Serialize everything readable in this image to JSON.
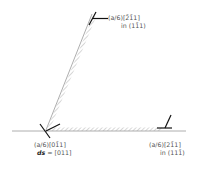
{
  "diagram": {
    "type": "stacking-fault dislocation reaction",
    "labels": {
      "top_partial": {
        "line1": "(a/6)[2̄1̄1]",
        "line2": "in (11̄1)"
      },
      "bottom_left_partial": {
        "line1": "(a/6)[01̄1]",
        "line2_prefix": "ds",
        "line2_value": "= [011]"
      },
      "bottom_right_partial": {
        "line1": "(a/6)[21̄1]",
        "line2": "in (111̄)"
      }
    },
    "colors": {
      "line": "#888888",
      "hatch": "#999999",
      "dislocation_symbol": "#111111",
      "text": "#555555"
    }
  }
}
